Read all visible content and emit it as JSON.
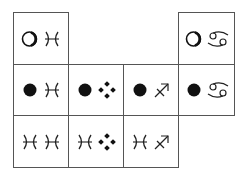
{
  "grid": {
    "line_color": "#555555",
    "glyph_color": "#111111",
    "columns_x": [
      13,
      68,
      123,
      178,
      234
    ],
    "rows_y": [
      12,
      64,
      115,
      167
    ],
    "cells": [
      {
        "row": 0,
        "col": 0,
        "symbols": [
          "hollow-circle",
          "pisces"
        ]
      },
      {
        "row": 0,
        "col": 3,
        "symbols": [
          "hollow-circle",
          "cancer"
        ]
      },
      {
        "row": 1,
        "col": 0,
        "symbols": [
          "filled-circle",
          "pisces"
        ]
      },
      {
        "row": 1,
        "col": 1,
        "symbols": [
          "filled-circle",
          "four-dot-diamond"
        ]
      },
      {
        "row": 1,
        "col": 2,
        "symbols": [
          "filled-circle",
          "sagittarius"
        ]
      },
      {
        "row": 1,
        "col": 3,
        "symbols": [
          "filled-circle",
          "cancer"
        ]
      },
      {
        "row": 2,
        "col": 0,
        "symbols": [
          "pisces",
          "pisces"
        ]
      },
      {
        "row": 2,
        "col": 1,
        "symbols": [
          "pisces",
          "four-dot-diamond"
        ]
      },
      {
        "row": 2,
        "col": 2,
        "symbols": [
          "pisces",
          "sagittarius"
        ]
      }
    ]
  }
}
